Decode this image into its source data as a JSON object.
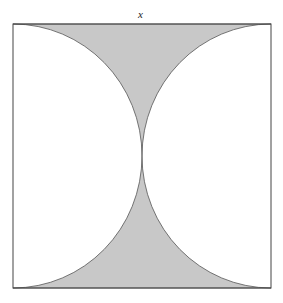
{
  "diagram": {
    "side_label": "x",
    "colors": {
      "shade": "#c8c8c8",
      "stroke": "#444444",
      "background": "#ffffff"
    }
  }
}
